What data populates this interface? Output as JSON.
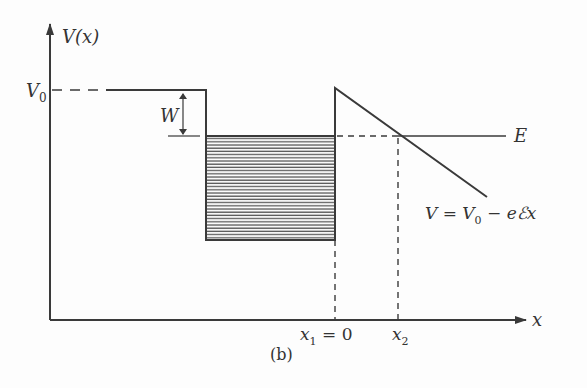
{
  "figure": {
    "caption": "(b)",
    "y_axis_label": "V(x)",
    "x_axis_label": "x",
    "v0_label": "V",
    "v0_sub": "0",
    "w_label": "W",
    "e_label": "E",
    "x1_label": "x",
    "x1_sub": "1",
    "x1_value": " = 0",
    "x2_label": "x",
    "x2_sub": "2",
    "formula": {
      "lhs": "V = V",
      "sub": "0",
      "rhs": " − eℰx"
    }
  },
  "colors": {
    "line": "#3a3a3a",
    "hatch": "#555555",
    "background": "#fdfdfd"
  }
}
